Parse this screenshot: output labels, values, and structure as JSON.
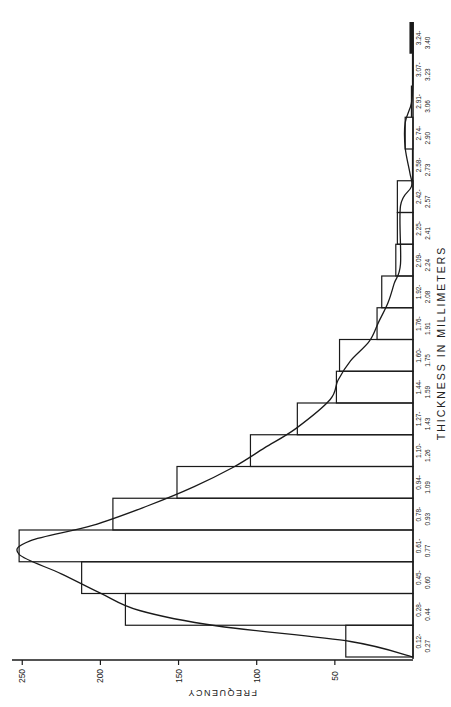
{
  "chart_data": {
    "type": "bar",
    "orientation": "rotated-90-ccw",
    "title": "",
    "xlabel": "THICKNESS IN MILLIMETERS",
    "ylabel": "FREQUENCY",
    "categories": [
      "0.12-0.27",
      "0.28-0.44",
      "0.45-0.60",
      "0.61-0.77",
      "0.78-0.93",
      "0.94-1.09",
      "1.10-1.26",
      "1.27-1.43",
      "1.44-1.59",
      "1.60-1.75",
      "1.76-1.91",
      "1.92-2.08",
      "2.09-2.24",
      "2.25-2.41",
      "2.42-2.57",
      "2.58-2.73",
      "2.74-2.90",
      "2.91-3.06",
      "3.07-3.23",
      "3.24-3.40"
    ],
    "category_labels": [
      [
        "0.12-",
        "0.27"
      ],
      [
        "0.28-",
        "0.44"
      ],
      [
        "0.45-",
        "0.60"
      ],
      [
        "0.61-",
        "0.77"
      ],
      [
        "0.78-",
        "0.93"
      ],
      [
        "0.94-",
        "1.09"
      ],
      [
        "1.10-",
        "1.26"
      ],
      [
        "1.27-",
        "1.43"
      ],
      [
        "1.44-",
        "1.59"
      ],
      [
        "1.60-",
        "1.75"
      ],
      [
        "1.76-",
        "1.91"
      ],
      [
        "1.92-",
        "2.08"
      ],
      [
        "2.09-",
        "2.24"
      ],
      [
        "2.25-",
        "2.41"
      ],
      [
        "2.42-",
        "2.57"
      ],
      [
        "2.58-",
        "2.73"
      ],
      [
        "2.74-",
        "2.90"
      ],
      [
        "2.91-",
        "3.06"
      ],
      [
        "3.07-",
        "3.23"
      ],
      [
        "3.24-",
        "3.40"
      ]
    ],
    "values": [
      43,
      184,
      212,
      252,
      192,
      151,
      104,
      74,
      49,
      47,
      23,
      20,
      11,
      10,
      10,
      0,
      5,
      1,
      0,
      1
    ],
    "fitted_curve": {
      "description": "smooth skewed distribution curve overlaid on histogram",
      "points": [
        [
          0.12,
          0
        ],
        [
          0.2,
          40
        ],
        [
          0.28,
          125
        ],
        [
          0.36,
          175
        ],
        [
          0.45,
          200
        ],
        [
          0.55,
          225
        ],
        [
          0.65,
          252
        ],
        [
          0.72,
          245
        ],
        [
          0.8,
          205
        ],
        [
          0.9,
          170
        ],
        [
          1.0,
          140
        ],
        [
          1.1,
          115
        ],
        [
          1.2,
          95
        ],
        [
          1.3,
          75
        ],
        [
          1.45,
          53
        ],
        [
          1.55,
          48
        ],
        [
          1.65,
          40
        ],
        [
          1.75,
          28
        ],
        [
          1.85,
          22
        ],
        [
          1.95,
          16
        ],
        [
          2.05,
          12
        ],
        [
          2.15,
          8
        ],
        [
          2.45,
          8
        ],
        [
          2.55,
          1
        ],
        [
          2.62,
          2
        ],
        [
          2.75,
          5
        ],
        [
          2.88,
          5
        ],
        [
          2.98,
          1
        ],
        [
          3.1,
          0
        ],
        [
          3.4,
          0
        ]
      ]
    },
    "yticks": [
      50,
      100,
      150,
      200,
      250
    ],
    "ylim": [
      0,
      260
    ],
    "grid": false,
    "legend": null
  }
}
